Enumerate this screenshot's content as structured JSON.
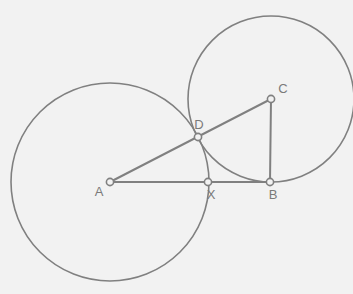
{
  "figure": {
    "canvas": {
      "width": 353,
      "height": 294
    },
    "background_color": "#f2f2f2",
    "stroke_color": "#808080",
    "label_color": "#7a7a7a",
    "marker_fill": "#f2f2f2",
    "circle_stroke_width": 1.6,
    "segment_stroke_width": 2.0,
    "marker_radius": 3.6
  },
  "chart_data": {
    "type": "diagram",
    "xlabel": "",
    "ylabel": "",
    "xlim": [
      0,
      353
    ],
    "ylim": [
      294,
      0
    ],
    "grid": false,
    "legend": "none",
    "circles": [
      {
        "name": "circle-A",
        "center_label": "A",
        "cx": 110,
        "cy": 182,
        "r": 99,
        "stroke": "#808080"
      },
      {
        "name": "circle-C",
        "center_label": "C",
        "cx": 271,
        "cy": 99,
        "r": 83,
        "stroke": "#808080"
      }
    ],
    "points": [
      {
        "id": "A",
        "label": "A",
        "x": 110,
        "y": 182,
        "label_dx": -11,
        "label_dy": 14
      },
      {
        "id": "D",
        "label": "D",
        "x": 198,
        "y": 137,
        "label_dx": 1,
        "label_dy": -8
      },
      {
        "id": "C",
        "label": "C",
        "x": 271,
        "y": 99,
        "label_dx": 12,
        "label_dy": -6
      },
      {
        "id": "X",
        "label": "X",
        "x": 208,
        "y": 182,
        "label_dx": 3,
        "label_dy": 17
      },
      {
        "id": "B",
        "label": "B",
        "x": 270,
        "y": 182,
        "label_dx": 3,
        "label_dy": 17
      }
    ],
    "segments": [
      {
        "name": "segment-AC",
        "from": "A",
        "to": "C",
        "x1": 110,
        "y1": 182,
        "x2": 271,
        "y2": 99,
        "stroke": "#808080"
      },
      {
        "name": "segment-AB",
        "from": "A",
        "to": "B",
        "x1": 110,
        "y1": 182,
        "x2": 270,
        "y2": 182,
        "stroke": "#808080"
      },
      {
        "name": "segment-CB",
        "from": "C",
        "to": "B",
        "x1": 271,
        "y1": 99,
        "x2": 270,
        "y2": 182,
        "stroke": "#808080"
      }
    ],
    "notes": {
      "D_description": "Intersection of segment AC with both circles",
      "X_description": "Intersection of segment AB with circle A"
    }
  }
}
